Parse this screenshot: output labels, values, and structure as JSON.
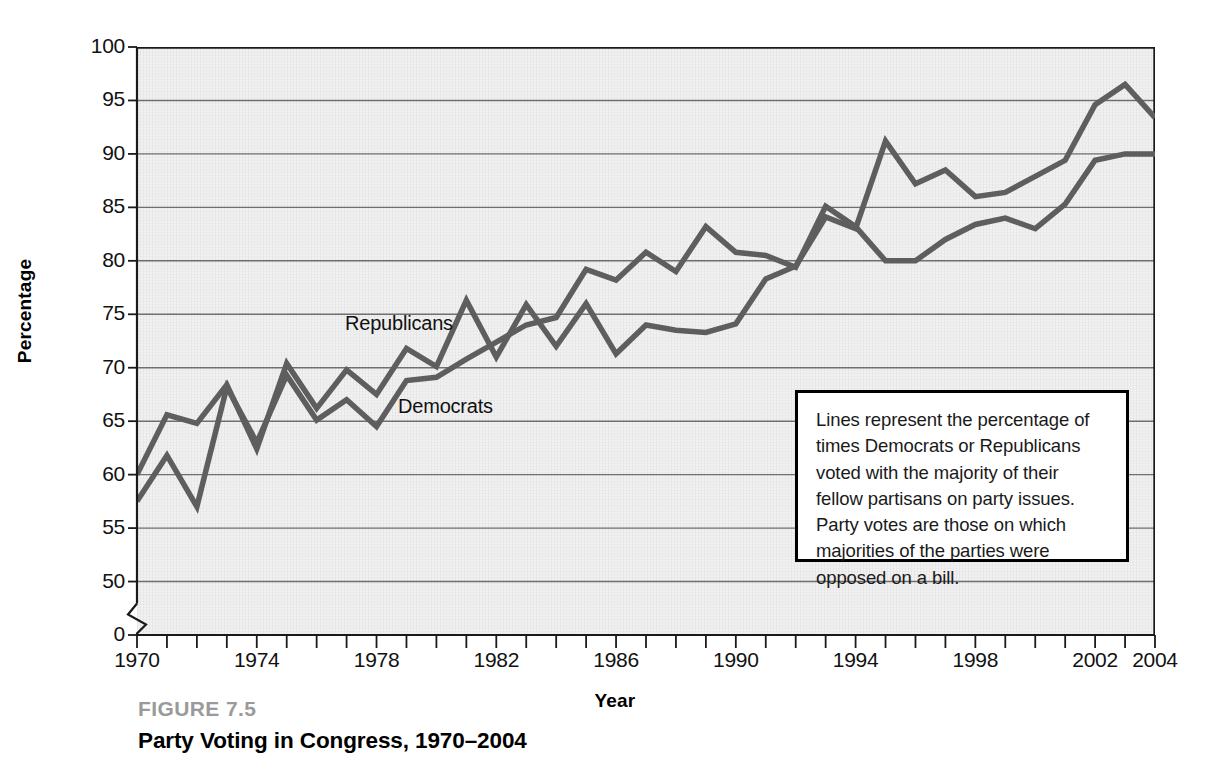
{
  "figure": {
    "caption_number": "FIGURE 7.5",
    "caption_title": "Party Voting in Congress, 1970–2004"
  },
  "annotation": {
    "text": "Lines represent the percentage of times Democrats or Republicans voted with the majority of their fellow partisans on party issues. Party votes are those on which majorities of the parties were opposed on a bill."
  },
  "series_labels": {
    "republicans": "Republicans",
    "democrats": "Democrats"
  },
  "colors": {
    "line": "#5e5e5e",
    "plot_background": "#f1f1f1",
    "gridline": "#6f6f6f",
    "axis": "#1a1a1a",
    "caption_number": "#9a9a9a"
  },
  "chart_data": {
    "type": "line",
    "title": "Party Voting in Congress, 1970–2004",
    "xlabel": "Year",
    "ylabel": "Percentage",
    "xlim": [
      1970,
      2004
    ],
    "ylim": [
      45,
      100
    ],
    "ytick_labels": [
      "100",
      "95",
      "90",
      "85",
      "80",
      "75",
      "70",
      "65",
      "60",
      "55",
      "50",
      "0"
    ],
    "ytick_values": [
      100,
      95,
      90,
      85,
      80,
      75,
      70,
      65,
      60,
      55,
      50,
      0
    ],
    "axis_break": true,
    "grid": "horizontal",
    "xtick_values": [
      1970,
      1971,
      1972,
      1973,
      1974,
      1975,
      1976,
      1977,
      1978,
      1979,
      1980,
      1981,
      1982,
      1983,
      1984,
      1985,
      1986,
      1987,
      1988,
      1989,
      1990,
      1991,
      1992,
      1993,
      1994,
      1995,
      1996,
      1997,
      1998,
      1999,
      2000,
      2001,
      2002,
      2003,
      2004
    ],
    "xtick_labels_shown": [
      "1970",
      "1974",
      "1978",
      "1982",
      "1986",
      "1990",
      "1994",
      "1998",
      "2002",
      "2004"
    ],
    "x": [
      1970,
      1971,
      1972,
      1973,
      1974,
      1975,
      1976,
      1977,
      1978,
      1979,
      1980,
      1981,
      1982,
      1983,
      1984,
      1985,
      1986,
      1987,
      1988,
      1989,
      1990,
      1991,
      1992,
      1993,
      1994,
      1995,
      1996,
      1997,
      1998,
      1999,
      2000,
      2001,
      2002,
      2003,
      2004
    ],
    "legend_position": "inline-labels",
    "series": [
      {
        "name": "Republicans",
        "values": [
          60.0,
          65.6,
          64.8,
          68.4,
          62.4,
          70.4,
          66.2,
          69.8,
          67.5,
          71.8,
          70.1,
          76.3,
          71.0,
          75.9,
          72.0,
          76.0,
          71.3,
          74.0,
          73.5,
          73.3,
          74.1,
          78.3,
          79.5,
          84.1,
          83.0,
          91.2,
          87.2,
          88.5,
          86.0,
          86.4,
          87.9,
          89.4,
          94.6,
          96.5,
          93.4
        ]
      },
      {
        "name": "Democrats",
        "values": [
          57.5,
          61.8,
          57.0,
          68.2,
          63.0,
          69.3,
          65.1,
          67.0,
          64.5,
          68.8,
          69.1,
          70.8,
          72.4,
          74.0,
          74.7,
          79.2,
          78.2,
          80.8,
          79.0,
          83.2,
          80.8,
          80.5,
          79.4,
          85.1,
          83.2,
          80.0,
          80.0,
          82.0,
          83.4,
          84.0,
          83.0,
          85.3,
          89.4,
          90.0,
          90.0
        ]
      }
    ]
  }
}
